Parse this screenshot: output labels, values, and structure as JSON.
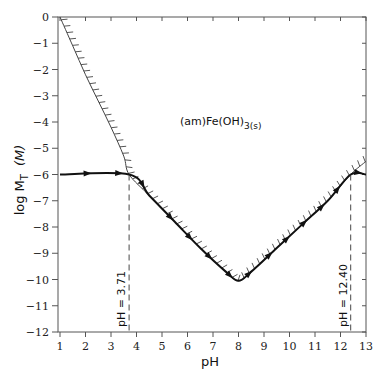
{
  "chart_data": {
    "type": "line",
    "title": "",
    "xlabel": "pH",
    "ylabel": "log M_T (M)",
    "ylabel_parts": {
      "main": "log M",
      "sub": "T",
      "unit": "(M)"
    },
    "xlim": [
      1,
      13
    ],
    "ylim": [
      -12,
      0
    ],
    "grid": false,
    "x_ticks": [
      1,
      2,
      3,
      4,
      5,
      6,
      7,
      8,
      9,
      10,
      11,
      12,
      13
    ],
    "y_ticks": [
      0,
      -1,
      -2,
      -3,
      -4,
      -5,
      -6,
      -7,
      -8,
      -9,
      -10,
      -11,
      -12
    ],
    "y_tick_labels": [
      "0",
      "−1",
      "−2",
      "−3",
      "−4",
      "−5",
      "−6",
      "−7",
      "−8",
      "−9",
      "−10",
      "−11",
      "−12"
    ],
    "series": [
      {
        "name": "solubility boundary (am)Fe(OH)3(s)",
        "style": "thin line with hatch marks",
        "x": [
          1.0,
          1.5,
          2.0,
          2.5,
          3.0,
          3.5,
          3.71,
          4.5,
          5.5,
          6.5,
          7.5,
          8.0,
          8.5,
          9.5,
          10.5,
          11.5,
          12.4,
          13.0
        ],
        "y": [
          0.0,
          -1.1,
          -2.2,
          -3.2,
          -4.2,
          -5.3,
          -6.0,
          -6.8,
          -7.8,
          -8.8,
          -9.7,
          -10.05,
          -9.7,
          -8.8,
          -7.9,
          -7.0,
          -6.0,
          -5.5
        ]
      },
      {
        "name": "titration path (log M_T)",
        "style": "thick line with arrows",
        "x": [
          1.0,
          3.71,
          4.5,
          5.5,
          6.5,
          7.5,
          8.0,
          8.5,
          9.5,
          10.5,
          11.5,
          12.4,
          13.0
        ],
        "y": [
          -6.0,
          -6.0,
          -6.8,
          -7.8,
          -8.8,
          -9.7,
          -10.05,
          -9.7,
          -8.8,
          -7.9,
          -7.0,
          -6.0,
          -6.0
        ]
      }
    ],
    "annotations": [
      {
        "text": "(am)Fe(OH)",
        "subscript": "3(s)",
        "x": 7.3,
        "y": -4.1
      },
      {
        "text": "pH = 3.71",
        "x": 3.71,
        "type": "vertical dashed line",
        "orientation": "vertical text"
      },
      {
        "text": "pH = 12.40",
        "x": 12.4,
        "type": "vertical dashed line",
        "orientation": "vertical text"
      }
    ]
  }
}
